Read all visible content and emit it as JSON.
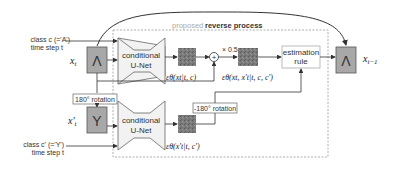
{
  "diagram": {
    "title_prefix": "proposed",
    "title_main": "reverse process",
    "inputs": {
      "top_class": "class c (='A')",
      "top_time": "time step t",
      "bottom_class": "class c' (='Y')",
      "bottom_time": "time step t"
    },
    "nodes": {
      "x_t_label": "x_t",
      "x_t_glyph": "Λ",
      "x_prime_t_label": "x'_t",
      "x_prime_t_glyph": "Y",
      "unet_top_line1": "conditional",
      "unet_top_line2": "U-Net",
      "unet_bottom_line1": "conditional",
      "unet_bottom_line2": "U-Net",
      "eps_top": "εθ(xt|t, c)",
      "eps_combined": "εθ(xt, x't|t, c, c')",
      "eps_bottom": "εθ(x't|t, c')",
      "scale": "× 0.5",
      "plus": "+",
      "estimation_line1": "estimation",
      "estimation_line2": "rule",
      "output_label": "x_{t−1}",
      "output_glyph": "Λ",
      "rotation_forward": "180° rotation",
      "rotation_backward": "-180° rotation"
    },
    "colors": {
      "line": "#333333",
      "dashed_box": "#999999",
      "image_fill": "#a8a8a8",
      "noise_fill": "#7a7a7a",
      "unet_fill": "#f2f2f2"
    }
  }
}
